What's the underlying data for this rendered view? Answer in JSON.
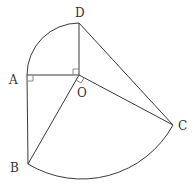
{
  "diagram": {
    "type": "geometry",
    "stroke_color": "#3a3a3a",
    "points": {
      "O": {
        "label": "O",
        "x": 79,
        "y": 75
      },
      "A": {
        "label": "A",
        "x": 27,
        "y": 75
      },
      "D": {
        "label": "D",
        "x": 79,
        "y": 23
      },
      "B": {
        "label": "B",
        "x": 28,
        "y": 164
      },
      "C": {
        "label": "C",
        "x": 173,
        "y": 125
      }
    },
    "segments": [
      "AO",
      "OD",
      "AB",
      "OB",
      "OC",
      "DC"
    ],
    "arcs": [
      {
        "from": "A",
        "to": "D",
        "center": "O",
        "description": "quarter-circle arc AD"
      },
      {
        "from": "B",
        "to": "C",
        "center": "O",
        "description": "arc BC"
      }
    ],
    "right_angles": [
      "OAB (at A)",
      "AOD (at O)",
      "BOC (at O)"
    ]
  }
}
